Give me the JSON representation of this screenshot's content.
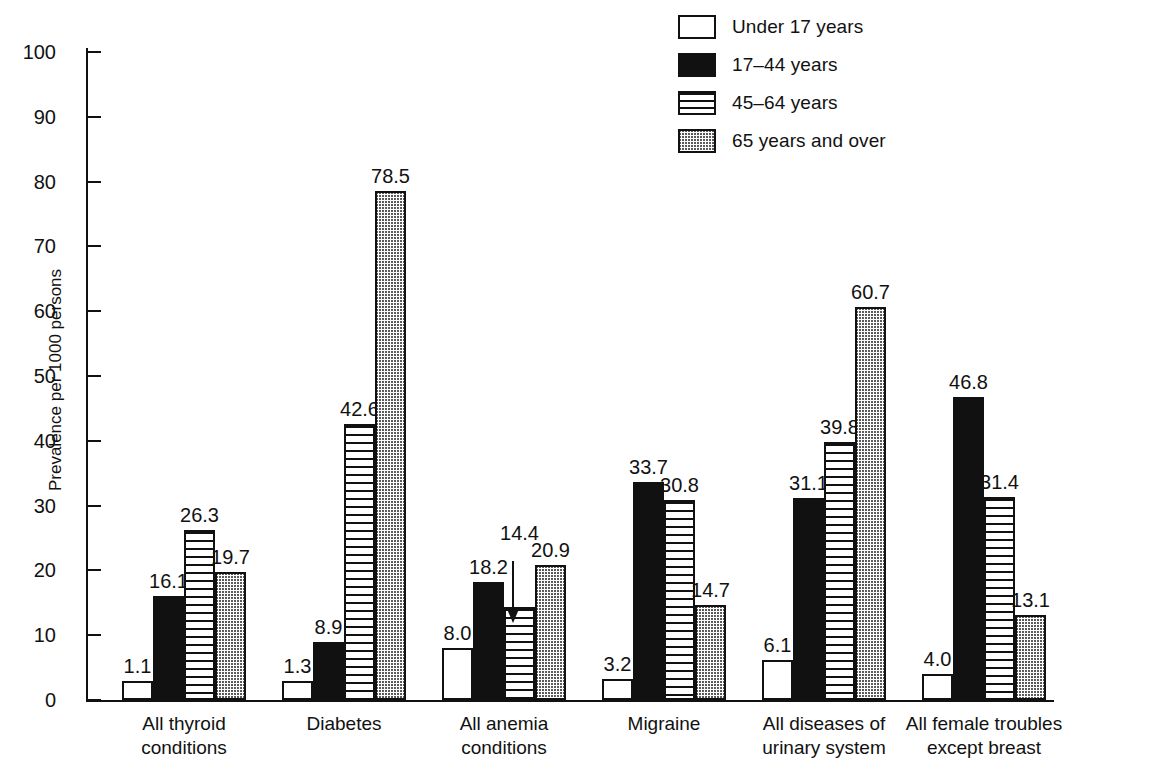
{
  "chart_data": {
    "type": "bar",
    "title": "",
    "subtitle": "",
    "xlabel": "",
    "ylabel": "Prevalence per 1000 persons",
    "ylim": [
      0,
      100
    ],
    "yticks": [
      0,
      10,
      20,
      30,
      40,
      50,
      60,
      70,
      80,
      90,
      100
    ],
    "grid": false,
    "legend_position": "top-right",
    "categories": [
      "All thyroid\nconditions",
      "Diabetes",
      "All anemia\nconditions",
      "Migraine",
      "All diseases of\nurinary system",
      "All female troubles\nexcept breast"
    ],
    "series": [
      {
        "name": "Under 17 years",
        "pattern": "open",
        "color": "#ffffff",
        "values": [
          1.1,
          1.3,
          8.0,
          3.2,
          6.1,
          4.0
        ],
        "labels": [
          "1.1",
          "1.3",
          "8.0",
          "3.2",
          "6.1",
          "4.0"
        ]
      },
      {
        "name": "17–44 years",
        "pattern": "solid",
        "color": "#111111",
        "values": [
          16.1,
          8.9,
          18.2,
          33.7,
          31.1,
          46.8
        ],
        "labels": [
          "16.1",
          "8.9",
          "18.2",
          "33.7",
          "31.1",
          "46.8"
        ]
      },
      {
        "name": "45–64 years",
        "pattern": "horizontal-stripes",
        "color": "#ffffff",
        "values": [
          26.3,
          42.6,
          14.4,
          30.8,
          39.8,
          31.4
        ],
        "labels": [
          "26.3",
          "42.6",
          "14.4",
          "30.8",
          "39.8",
          "31.4"
        ]
      },
      {
        "name": "65 years and over",
        "pattern": "stipple",
        "color": "#d9d9d9",
        "values": [
          19.7,
          78.5,
          20.9,
          14.7,
          60.7,
          13.1
        ],
        "labels": [
          "19.7",
          "78.5",
          "20.9",
          "14.7",
          "60.7",
          "13.1"
        ]
      }
    ],
    "annotations": [
      {
        "text": "14.4",
        "type": "arrow-down",
        "points_to": "All anemia conditions / 45–64 years"
      }
    ]
  },
  "legend": {
    "items": [
      {
        "label": "Under 17 years",
        "swatch": "open-swatch"
      },
      {
        "label": "17–44 years",
        "swatch": "solid-swatch"
      },
      {
        "label": "45–64 years",
        "swatch": "striped-swatch"
      },
      {
        "label": "65 years and over",
        "swatch": "stipple-swatch"
      }
    ]
  },
  "axis": {
    "y_title": "Prevalence per 1000 persons",
    "y_tick_labels": [
      "100",
      "90",
      "80",
      "70",
      "60",
      "50",
      "40",
      "30",
      "20",
      "10",
      "0"
    ]
  },
  "colors": {
    "ink": "#111111",
    "background": "#ffffff",
    "stipple": "#d9d9d9"
  }
}
